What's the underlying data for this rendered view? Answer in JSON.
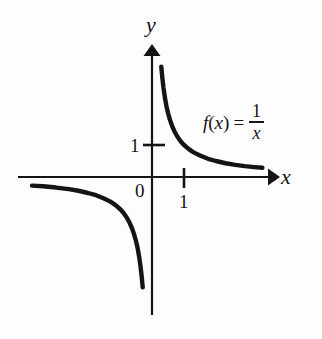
{
  "figure": {
    "background_color": "#fdfdfd",
    "ink_color": "#141414"
  },
  "axes": {
    "x_label": "x",
    "y_label": "y",
    "origin_label": "0",
    "x_tick_label": "1",
    "y_tick_label": "1"
  },
  "annotation": {
    "function_name": "f",
    "open_paren": "(",
    "variable": "x",
    "close_paren": ")",
    "equals": "=",
    "numerator": "1",
    "denominator": "x"
  },
  "chart_data": {
    "type": "line",
    "title": "",
    "subtitle": "",
    "xlabel": "x",
    "ylabel": "y",
    "function": "f(x) = 1/x",
    "grid": false,
    "legend": "none",
    "annotations": [
      "f(x) = 1/x"
    ],
    "xlim": [
      -4.2,
      3.6
    ],
    "ylim": [
      -3.8,
      3.7
    ],
    "xticks": [
      1
    ],
    "xtick_labels": [
      "1"
    ],
    "yticks": [
      1
    ],
    "ytick_labels": [
      "1"
    ],
    "origin_tick_label": "0",
    "series": [
      {
        "name": "branch-quadrant-I",
        "x": [
          0.29,
          0.32,
          0.36,
          0.4,
          0.45,
          0.5,
          0.56,
          0.63,
          0.7,
          0.8,
          0.9,
          1.0,
          1.15,
          1.3,
          1.5,
          1.75,
          2.0,
          2.3,
          2.6,
          2.9,
          3.2,
          3.45
        ],
        "y": [
          3.45,
          3.13,
          2.78,
          2.5,
          2.22,
          2.0,
          1.79,
          1.59,
          1.43,
          1.25,
          1.11,
          1.0,
          0.87,
          0.77,
          0.67,
          0.57,
          0.5,
          0.43,
          0.38,
          0.34,
          0.31,
          0.29
        ]
      },
      {
        "name": "branch-quadrant-III",
        "x": [
          -3.75,
          -3.4,
          -3.0,
          -2.6,
          -2.3,
          -2.0,
          -1.75,
          -1.5,
          -1.3,
          -1.15,
          -1.0,
          -0.9,
          -0.8,
          -0.7,
          -0.63,
          -0.56,
          -0.5,
          -0.45,
          -0.4,
          -0.36,
          -0.32,
          -0.29
        ],
        "y": [
          -0.27,
          -0.29,
          -0.33,
          -0.38,
          -0.43,
          -0.5,
          -0.57,
          -0.67,
          -0.77,
          -0.87,
          -1.0,
          -1.11,
          -1.25,
          -1.43,
          -1.59,
          -1.79,
          -2.0,
          -2.22,
          -2.5,
          -2.78,
          -3.13,
          -3.45
        ]
      }
    ]
  }
}
